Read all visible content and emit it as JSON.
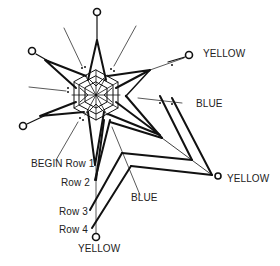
{
  "diagram": {
    "type": "pattern-instruction",
    "labels": {
      "yellow_top_right": "YELLOW",
      "blue_right": "BLUE",
      "begin_row1": "BEGIN Row 1",
      "row2": "Row 2",
      "blue_bottom": "BLUE",
      "row3": "Row 3",
      "row4": "Row 4",
      "yellow_bottom": "YELLOW",
      "yellow_right": "YELLOW"
    },
    "colors": {
      "ink": "#111111",
      "background": "#ffffff"
    }
  }
}
